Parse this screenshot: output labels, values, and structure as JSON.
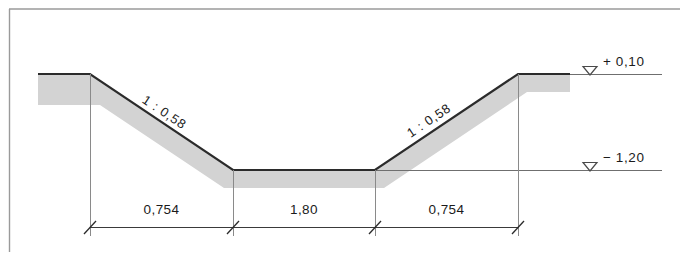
{
  "drawing": {
    "type": "engineering-cross-section",
    "subject": "Trapezoidal channel cross section",
    "colors": {
      "outline": "#2b2b2b",
      "fill": "#d3d3d3",
      "thin_line": "#7a7a7a",
      "frame": "#9a9a9a",
      "text": "#1b1b1b"
    },
    "frame": {
      "visible_edges": "top-left-partial"
    },
    "elevations": [
      {
        "id": "top",
        "symbol": "▽",
        "label": "+ 0,10"
      },
      {
        "id": "bottom",
        "symbol": "▽",
        "label": "− 1,20"
      }
    ],
    "slopes": [
      {
        "id": "left-slope",
        "label": "1 : 0,58"
      },
      {
        "id": "right-slope",
        "label": "1 : 0,58"
      }
    ],
    "dimensions": [
      {
        "id": "left-slope-width",
        "label": "0,754"
      },
      {
        "id": "channel-bottom-width",
        "label": "1,80"
      },
      {
        "id": "right-slope-width",
        "label": "0,754"
      }
    ]
  }
}
